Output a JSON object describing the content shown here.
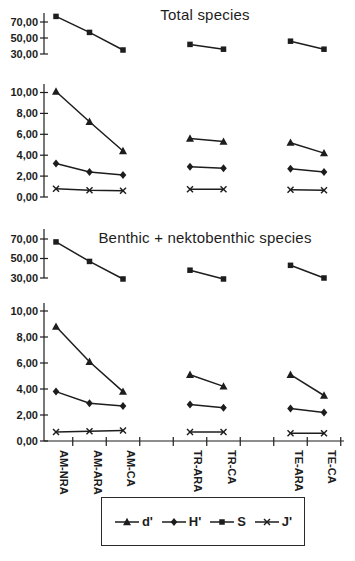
{
  "figure": {
    "panel_count": 2
  },
  "chart_data": [
    {
      "type": "line",
      "title": "Total species",
      "categories": [
        "AM-NRA",
        "AM-ARA",
        "AM-CA",
        "TR-ARA",
        "TR-CA",
        "TE-ARA",
        "TE-CA"
      ],
      "category_groups": [
        [
          0,
          1,
          2
        ],
        [
          3,
          4
        ],
        [
          5,
          6
        ]
      ],
      "y_axis_upper": {
        "range": [
          30,
          70
        ],
        "ticks": [
          {
            "value": 70,
            "label": "70,00"
          },
          {
            "value": 50,
            "label": "50,00"
          },
          {
            "value": 30,
            "label": "30,00"
          }
        ]
      },
      "y_axis_lower": {
        "range": [
          0,
          10
        ],
        "ticks": [
          {
            "value": 10,
            "label": "10,00"
          },
          {
            "value": 8,
            "label": "8,00"
          },
          {
            "value": 6,
            "label": "6,00"
          },
          {
            "value": 4,
            "label": "4,00"
          },
          {
            "value": 2,
            "label": "2,00"
          },
          {
            "value": 0,
            "label": "0,00"
          }
        ]
      },
      "series": [
        {
          "name": "d'",
          "marker": "triangle",
          "axis": "lower",
          "values": [
            10.1,
            7.2,
            4.4,
            5.6,
            5.3,
            5.2,
            4.2
          ]
        },
        {
          "name": "H'",
          "marker": "diamond",
          "axis": "lower",
          "values": [
            3.2,
            2.4,
            2.1,
            2.9,
            2.75,
            2.7,
            2.4
          ]
        },
        {
          "name": "S",
          "marker": "square",
          "axis": "upper",
          "values": [
            77,
            57,
            35,
            42,
            36,
            46,
            36
          ]
        },
        {
          "name": "J'",
          "marker": "x",
          "axis": "lower",
          "values": [
            0.8,
            0.65,
            0.6,
            0.75,
            0.75,
            0.7,
            0.65
          ]
        }
      ]
    },
    {
      "type": "line",
      "title": "Benthic + nektobenthic species",
      "categories": [
        "AM-NRA",
        "AM-ARA",
        "AM-CA",
        "TR-ARA",
        "TR-CA",
        "TE-ARA",
        "TE-CA"
      ],
      "category_groups": [
        [
          0,
          1,
          2
        ],
        [
          3,
          4
        ],
        [
          5,
          6
        ]
      ],
      "y_axis_upper": {
        "range": [
          30,
          70
        ],
        "ticks": [
          {
            "value": 70,
            "label": "70,00"
          },
          {
            "value": 50,
            "label": "50,00"
          },
          {
            "value": 30,
            "label": "30,00"
          }
        ]
      },
      "y_axis_lower": {
        "range": [
          0,
          10
        ],
        "ticks": [
          {
            "value": 10,
            "label": "10,00"
          },
          {
            "value": 8,
            "label": "8,00"
          },
          {
            "value": 6,
            "label": "6,00"
          },
          {
            "value": 4,
            "label": "4,00"
          },
          {
            "value": 2,
            "label": "2,00"
          },
          {
            "value": 0,
            "label": "0,00"
          }
        ]
      },
      "series": [
        {
          "name": "d'",
          "marker": "triangle",
          "axis": "lower",
          "values": [
            8.8,
            6.1,
            3.8,
            5.1,
            4.2,
            5.1,
            3.5
          ]
        },
        {
          "name": "H'",
          "marker": "diamond",
          "axis": "lower",
          "values": [
            3.8,
            2.9,
            2.7,
            2.8,
            2.55,
            2.5,
            2.2
          ]
        },
        {
          "name": "S",
          "marker": "square",
          "axis": "upper",
          "values": [
            67,
            47,
            29,
            38,
            29,
            43,
            30
          ]
        },
        {
          "name": "J'",
          "marker": "x",
          "axis": "lower",
          "values": [
            0.7,
            0.75,
            0.8,
            0.7,
            0.7,
            0.6,
            0.6
          ]
        }
      ]
    }
  ],
  "legend": {
    "items": [
      {
        "label": "d'",
        "marker": "triangle"
      },
      {
        "label": "H'",
        "marker": "diamond"
      },
      {
        "label": "S",
        "marker": "square"
      },
      {
        "label": "J'",
        "marker": "x"
      }
    ]
  },
  "colors": {
    "ink": "#1d1d1d",
    "background": "#ffffff"
  }
}
